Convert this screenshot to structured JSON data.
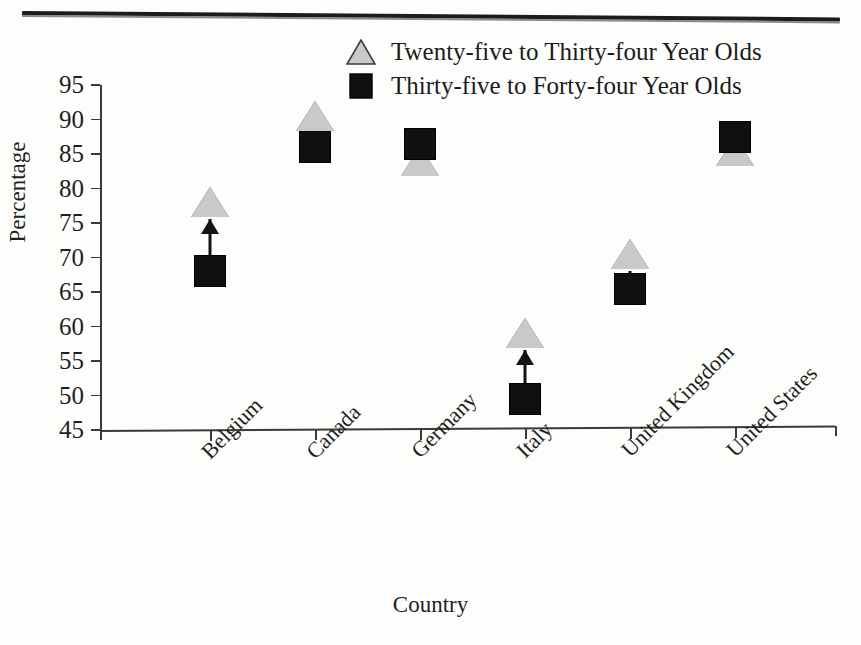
{
  "chart_data": {
    "type": "scatter",
    "title": "",
    "xlabel": "Country",
    "ylabel": "Percentage",
    "ylim": [
      45,
      95
    ],
    "ytick_labels": [
      "95",
      "90",
      "85",
      "80",
      "75",
      "70",
      "65",
      "60",
      "55",
      "50",
      "45"
    ],
    "ytick_values": [
      95,
      90,
      85,
      80,
      75,
      70,
      65,
      60,
      55,
      50,
      45
    ],
    "grid": false,
    "legend_position": "top-center",
    "categories": [
      "Belgium",
      "Canada",
      "Germany",
      "Italy",
      "United Kingdom",
      "United States"
    ],
    "series": [
      {
        "name": "Twenty-five to Thirty-four Year Olds",
        "marker": "triangle",
        "color": "#c9c9c9",
        "values": [
          78,
          90.5,
          84,
          59,
          70.5,
          85.5
        ]
      },
      {
        "name": "Thirty-five to Forty-four Year Olds",
        "marker": "square",
        "color": "#101010",
        "values": [
          68,
          86,
          86.5,
          49.5,
          65.5,
          87.5
        ]
      }
    ],
    "annotations": [
      {
        "category": "Belgium",
        "type": "arrow",
        "from": 68,
        "to": 78
      },
      {
        "category": "Italy",
        "type": "arrow",
        "from": 49.5,
        "to": 59
      },
      {
        "category": "United Kingdom",
        "type": "arrow",
        "from": 65.5,
        "to": 70.5
      }
    ]
  },
  "legend": {
    "items": [
      {
        "label": "Twenty-five to Thirty-four Year Olds",
        "marker": "triangle"
      },
      {
        "label": "Thirty-five to Forty-four Year Olds",
        "marker": "square"
      }
    ]
  },
  "axes": {
    "y_title": "Percentage",
    "x_title": "Country"
  }
}
